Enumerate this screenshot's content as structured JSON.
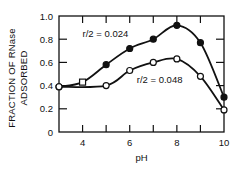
{
  "chart_data": {
    "type": "line",
    "title": "",
    "xlabel": "pH",
    "ylabel_line1": "FRACTION OF RNase",
    "ylabel_line2": "ADSORBED",
    "xlim": [
      3,
      10
    ],
    "ylim": [
      0,
      1.0
    ],
    "x_ticks": [
      4,
      6,
      8,
      10
    ],
    "x_tick_marks": [
      4,
      5,
      6,
      7,
      8,
      9
    ],
    "y_ticks": [
      0,
      0.2,
      0.4,
      0.6,
      0.8,
      1.0
    ],
    "y_tick_labels": [
      "0",
      "0.2",
      "0.4",
      "0.6",
      "0.8",
      "1.0"
    ],
    "grid": false,
    "legend_position": "inline annotations",
    "series": [
      {
        "name": "r/2 = 0.024",
        "marker": "filled-circle",
        "x": [
          3,
          4,
          5,
          6,
          7,
          8,
          9,
          10
        ],
        "values": [
          0.39,
          0.43,
          0.58,
          0.72,
          0.8,
          0.92,
          0.77,
          0.3
        ],
        "label_pos": {
          "x": 4.0,
          "y": 0.82
        }
      },
      {
        "name": "r/2 = 0.048",
        "marker": "open-circle",
        "x": [
          3,
          5,
          6,
          7,
          8,
          9,
          10
        ],
        "values": [
          0.39,
          0.4,
          0.53,
          0.6,
          0.63,
          0.48,
          0.19
        ],
        "label_pos": {
          "x": 6.3,
          "y": 0.42
        }
      }
    ],
    "annotations": [
      "r/2 = 0.024",
      "r/2 = 0.048"
    ]
  }
}
